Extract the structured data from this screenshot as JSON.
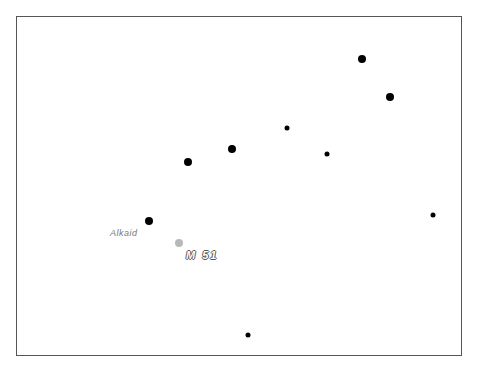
{
  "chart": {
    "frame": {
      "x": 16,
      "y": 16,
      "width": 446,
      "height": 340
    },
    "stars": [
      {
        "name": "Alkaid",
        "x": 149,
        "y": 221,
        "r": 4
      },
      {
        "x": 188,
        "y": 162,
        "r": 4
      },
      {
        "x": 232,
        "y": 149,
        "r": 4
      },
      {
        "x": 287,
        "y": 128,
        "r": 2.5
      },
      {
        "x": 327,
        "y": 154,
        "r": 2.5
      },
      {
        "x": 362,
        "y": 59,
        "r": 4
      },
      {
        "x": 390,
        "y": 97,
        "r": 4
      },
      {
        "x": 433,
        "y": 215,
        "r": 2.5
      },
      {
        "x": 248,
        "y": 335,
        "r": 2.5
      }
    ],
    "objects": [
      {
        "name": "M 51",
        "x": 179,
        "y": 243,
        "r": 4,
        "color": "#b8b8b8"
      }
    ],
    "labels": {
      "alkaid": "Alkaid",
      "m51": "M 51"
    }
  }
}
